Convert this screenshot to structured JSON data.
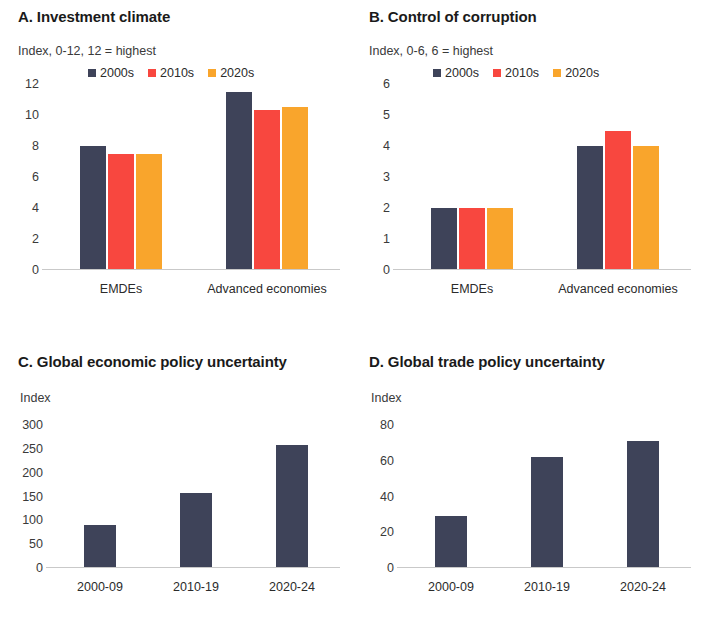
{
  "colors": {
    "navy": "#3e4359",
    "red": "#f8473f",
    "orange": "#f9a52c",
    "axis": "#c9c9c9",
    "text": "#231f20"
  },
  "legend": {
    "items": [
      {
        "label": "2000s",
        "color": "#3e4359"
      },
      {
        "label": "2010s",
        "color": "#f8473f"
      },
      {
        "label": "2020s",
        "color": "#f9a52c"
      }
    ]
  },
  "panels": {
    "a": {
      "title": "A. Investment climate",
      "unit": "Index, 0-12, 12 = highest",
      "yticks": [
        "12",
        "10",
        "8",
        "6",
        "4",
        "2",
        "0"
      ],
      "groups": [
        "EMDEs",
        "Advanced economies"
      ]
    },
    "b": {
      "title": "B. Control of corruption",
      "unit": "Index, 0-6, 6 = highest",
      "yticks": [
        "6",
        "5",
        "4",
        "3",
        "2",
        "1",
        "0"
      ],
      "groups": [
        "EMDEs",
        "Advanced economies"
      ]
    },
    "c": {
      "title": "C. Global economic policy uncertainty",
      "unit": "Index",
      "yticks": [
        "300",
        "250",
        "200",
        "150",
        "100",
        "50",
        "0"
      ],
      "groups": [
        "2000-09",
        "2010-19",
        "2020-24"
      ]
    },
    "d": {
      "title": "D. Global trade policy uncertainty",
      "unit": "Index",
      "yticks": [
        "80",
        "60",
        "40",
        "20",
        "0"
      ],
      "groups": [
        "2000-09",
        "2010-19",
        "2020-24"
      ]
    }
  },
  "chart_data": [
    {
      "panel": "A",
      "type": "bar",
      "title": "A. Investment climate",
      "ylabel": "Index, 0-12, 12 = highest",
      "xlabel": "",
      "categories": [
        "EMDEs",
        "Advanced economies"
      ],
      "series": [
        {
          "name": "2000s",
          "color": "#3e4359",
          "values": [
            8.0,
            11.5
          ]
        },
        {
          "name": "2010s",
          "color": "#f8473f",
          "values": [
            7.5,
            10.3
          ]
        },
        {
          "name": "2020s",
          "color": "#f9a52c",
          "values": [
            7.5,
            10.5
          ]
        }
      ],
      "ylim": [
        0,
        12
      ],
      "ytick_values": [
        0,
        2,
        4,
        6,
        8,
        10,
        12
      ],
      "grid": false,
      "legend_position": "top"
    },
    {
      "panel": "B",
      "type": "bar",
      "title": "B. Control of corruption",
      "ylabel": "Index, 0-6, 6 = highest",
      "xlabel": "",
      "categories": [
        "EMDEs",
        "Advanced economies"
      ],
      "series": [
        {
          "name": "2000s",
          "color": "#3e4359",
          "values": [
            2.0,
            4.0
          ]
        },
        {
          "name": "2010s",
          "color": "#f8473f",
          "values": [
            2.0,
            4.5
          ]
        },
        {
          "name": "2020s",
          "color": "#f9a52c",
          "values": [
            2.0,
            4.0
          ]
        }
      ],
      "ylim": [
        0,
        6
      ],
      "ytick_values": [
        0,
        1,
        2,
        3,
        4,
        5,
        6
      ],
      "grid": false,
      "legend_position": "top"
    },
    {
      "panel": "C",
      "type": "bar",
      "title": "C. Global economic policy uncertainty",
      "ylabel": "Index",
      "xlabel": "",
      "categories": [
        "2000-09",
        "2010-19",
        "2020-24"
      ],
      "values": [
        90,
        158,
        258
      ],
      "color": "#3e4359",
      "ylim": [
        0,
        300
      ],
      "ytick_values": [
        0,
        50,
        100,
        150,
        200,
        250,
        300
      ],
      "grid": false,
      "legend_position": "none"
    },
    {
      "panel": "D",
      "type": "bar",
      "title": "D. Global trade policy uncertainty",
      "ylabel": "Index",
      "xlabel": "",
      "categories": [
        "2000-09",
        "2010-19",
        "2020-24"
      ],
      "values": [
        29,
        62,
        71
      ],
      "color": "#3e4359",
      "ylim": [
        0,
        80
      ],
      "ytick_values": [
        0,
        20,
        40,
        60,
        80
      ],
      "grid": false,
      "legend_position": "none"
    }
  ]
}
